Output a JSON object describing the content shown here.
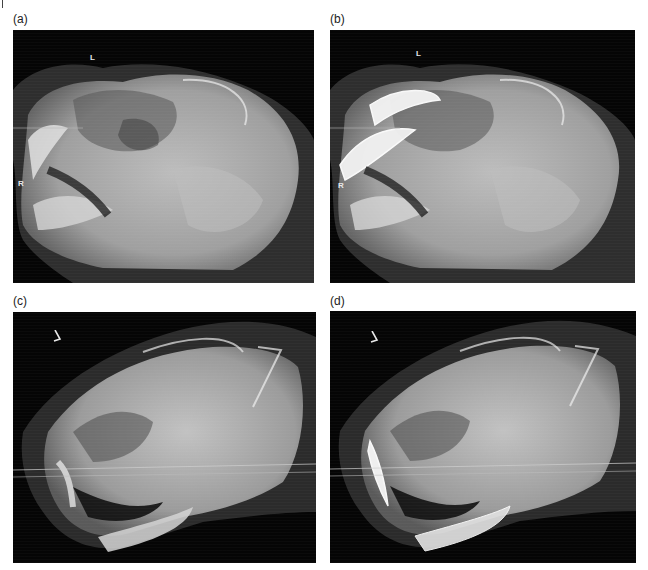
{
  "figure": {
    "panels": [
      {
        "id": "a",
        "label": "(a)",
        "view": "lateral skull radiograph, mouth open",
        "markers": [
          "L",
          "R"
        ],
        "highlighted_canines": false
      },
      {
        "id": "b",
        "label": "(b)",
        "view": "lateral skull radiograph, mouth open, canines outlined",
        "markers": [
          "L",
          "R"
        ],
        "highlighted_canines": true
      },
      {
        "id": "c",
        "label": "(c)",
        "view": "lateral skull radiograph, opposite side",
        "markers": [
          "L"
        ],
        "highlighted_canines": false
      },
      {
        "id": "d",
        "label": "(d)",
        "view": "lateral skull radiograph, opposite side, canines outlined",
        "markers": [
          "L"
        ],
        "highlighted_canines": true
      }
    ]
  },
  "colors": {
    "background": "#ffffff",
    "film": "#050505",
    "bone": "#d9d9d9",
    "marker": "#e8e8e8"
  }
}
